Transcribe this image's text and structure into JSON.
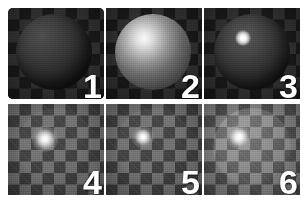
{
  "figure": {
    "background_color": "#ffffff",
    "rows": 2,
    "columns": 3,
    "panel_count": 6
  },
  "panels": [
    {
      "number": "1",
      "position": "row-1-col-1",
      "subject": "sphere",
      "background": "checkerboard",
      "description": "Dark matte sphere with no visible specular highlight",
      "highlight": "none",
      "body_tone": "dark",
      "checker_tone": "dark"
    },
    {
      "number": "2",
      "position": "row-1-col-2",
      "subject": "sphere",
      "background": "checkerboard",
      "description": "Sphere with broad diffuse upper-left highlight",
      "highlight": "broad",
      "body_tone": "mid",
      "checker_tone": "dark"
    },
    {
      "number": "3",
      "position": "row-1-col-3",
      "subject": "sphere",
      "background": "checkerboard",
      "description": "Dark sphere with small sharp specular highlight",
      "highlight": "tight",
      "body_tone": "dark",
      "checker_tone": "dark"
    },
    {
      "number": "4",
      "position": "row-2-col-1",
      "subject": "transmissive-sphere",
      "background": "checkerboard",
      "description": "Checkerboard visible through sphere with small bright highlight",
      "highlight": "point",
      "body_tone": "transparent",
      "checker_tone": "mid"
    },
    {
      "number": "5",
      "position": "row-2-col-2",
      "subject": "transmissive-sphere",
      "background": "checkerboard",
      "description": "Checkerboard visible through sphere with tighter bright highlight",
      "highlight": "point",
      "body_tone": "transparent",
      "checker_tone": "mid"
    },
    {
      "number": "6",
      "position": "row-2-col-3",
      "subject": "transmissive-sphere",
      "background": "checkerboard",
      "description": "Faint sphere silhouette over brighter checkerboard with bright highlight",
      "highlight": "point",
      "body_tone": "translucent",
      "checker_tone": "mid-bright"
    }
  ],
  "colors": {
    "page_background": "#ffffff",
    "label": "#ffffff",
    "checker_dark_a": "#171717",
    "checker_dark_b": "#2f2f2f",
    "checker_mid_a": "#3b3b3b",
    "checker_mid_b": "#6d6d6d",
    "checker_bright_a": "#4a4a4a",
    "checker_bright_b": "#7d7d7d"
  }
}
